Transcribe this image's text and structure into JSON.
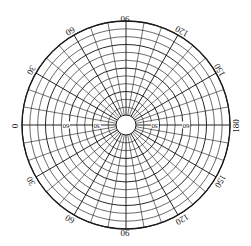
{
  "figure": {
    "title": "",
    "type": "polar-grid-diagram"
  },
  "chart_data": {
    "type": "polar",
    "title": "",
    "xlabel": "",
    "ylabel": "",
    "center": {
      "x": 126,
      "y": 125
    },
    "hub_radius": 10,
    "outer_radius": 104,
    "ring_count": 12,
    "spoke_count": 36,
    "spoke_step_deg": 10,
    "angular_tick_step_deg": 30,
    "radial_tick_step": 30,
    "grid": true,
    "legend": "none",
    "line_color": "#1a1a1a",
    "background_color": "#ffffff",
    "angular_labels": [
      {
        "id": "left-0",
        "text": "0",
        "deg": 180,
        "rotation": -90,
        "x": 14,
        "y": 126
      },
      {
        "id": "upper-left-30",
        "text": "30",
        "deg": 150,
        "rotation": -60,
        "x": 31,
        "y": 70
      },
      {
        "id": "upper-left-60",
        "text": "60",
        "deg": 120,
        "rotation": -30,
        "x": 70,
        "y": 31
      },
      {
        "id": "top-90",
        "text": "90",
        "deg": 90,
        "rotation": 0,
        "x": 125,
        "y": 18
      },
      {
        "id": "upper-right-120",
        "text": "120",
        "deg": 60,
        "rotation": 30,
        "x": 182,
        "y": 31
      },
      {
        "id": "upper-right-150",
        "text": "150",
        "deg": 30,
        "rotation": 60,
        "x": 220,
        "y": 70
      },
      {
        "id": "right-180",
        "text": "180",
        "deg": 0,
        "rotation": 90,
        "x": 236,
        "y": 126
      },
      {
        "id": "lower-right-150",
        "text": "150",
        "deg": -30,
        "rotation": -60,
        "x": 220,
        "y": 181
      },
      {
        "id": "lower-right-120",
        "text": "120",
        "deg": -60,
        "rotation": -30,
        "x": 182,
        "y": 219
      },
      {
        "id": "bottom-90",
        "text": "90",
        "deg": -90,
        "rotation": 0,
        "x": 125,
        "y": 232
      },
      {
        "id": "lower-left-60",
        "text": "60",
        "deg": -120,
        "rotation": 30,
        "x": 70,
        "y": 219
      },
      {
        "id": "lower-left-30",
        "text": "30",
        "deg": -150,
        "rotation": 60,
        "x": 31,
        "y": 181
      }
    ],
    "radial_labels": [
      {
        "id": "left-60",
        "text": "60",
        "x": 66,
        "y": 125,
        "rotation": 180
      },
      {
        "id": "left-30",
        "text": "30",
        "x": 97,
        "y": 125,
        "rotation": 180
      },
      {
        "id": "right-30",
        "text": "30",
        "x": 155,
        "y": 125,
        "rotation": 180
      },
      {
        "id": "right-60",
        "text": "60",
        "x": 186,
        "y": 125,
        "rotation": 180
      }
    ]
  }
}
